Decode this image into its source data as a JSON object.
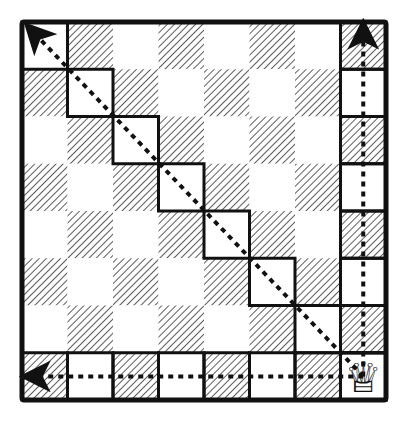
{
  "diagram": {
    "board": {
      "rows": 8,
      "cols": 8,
      "light_color": "#ffffff",
      "dark_pattern": "diagonal-hatch",
      "line_color": "#111111"
    },
    "piece": {
      "name": "queen",
      "glyph": "♕",
      "row": 7,
      "col": 7
    },
    "highlighted_paths": [
      {
        "name": "up",
        "from": [
          7,
          7
        ],
        "to": [
          0,
          7
        ]
      },
      {
        "name": "left",
        "from": [
          7,
          7
        ],
        "to": [
          7,
          0
        ]
      },
      {
        "name": "diagonal-up-left",
        "from": [
          7,
          7
        ],
        "to": [
          0,
          0
        ]
      }
    ]
  }
}
